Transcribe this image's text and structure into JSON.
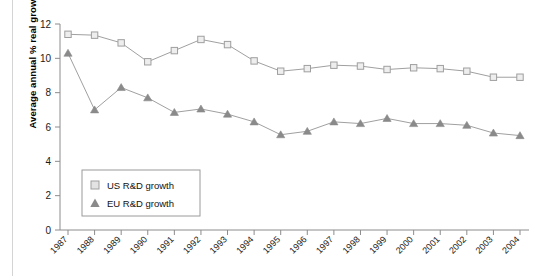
{
  "chart_data": {
    "type": "line",
    "title": "",
    "xlabel": "",
    "ylabel": "Average annual % real growth",
    "categories": [
      "1987",
      "1988",
      "1989",
      "1990",
      "1991",
      "1992",
      "1993",
      "1994",
      "1995",
      "1996",
      "1997",
      "1998",
      "1999",
      "2000",
      "2001",
      "2002",
      "2003",
      "2004"
    ],
    "ylim": [
      0,
      12
    ],
    "yticks": [
      0,
      2,
      4,
      6,
      8,
      10,
      12
    ],
    "ytick_labels": [
      "0",
      "2",
      "4",
      "6",
      "8",
      "10",
      "12"
    ],
    "grid": false,
    "legend_position": "inside-lower-left",
    "series": [
      {
        "name": "US R&D growth",
        "marker": "open-square",
        "color": "#c9c9c9",
        "line_color": "#a8a8a8",
        "values": [
          11.4,
          11.35,
          10.9,
          9.8,
          10.45,
          11.1,
          10.8,
          9.85,
          9.25,
          9.4,
          9.6,
          9.55,
          9.35,
          9.45,
          9.4,
          9.25,
          8.9,
          8.9
        ]
      },
      {
        "name": "EU R&D growth",
        "marker": "filled-triangle",
        "color": "#8a8a8a",
        "line_color": "#9e9e9e",
        "values": [
          10.3,
          7.0,
          8.3,
          7.7,
          6.85,
          7.05,
          6.75,
          6.3,
          5.55,
          5.75,
          6.3,
          6.2,
          6.5,
          6.2,
          6.2,
          6.1,
          5.65,
          5.5
        ]
      }
    ]
  },
  "legend": {
    "entries": [
      {
        "label": "US R&D growth"
      },
      {
        "label": "EU R&D growth"
      }
    ]
  },
  "axes": {
    "y_axis_title": "Average annual % real growth"
  }
}
